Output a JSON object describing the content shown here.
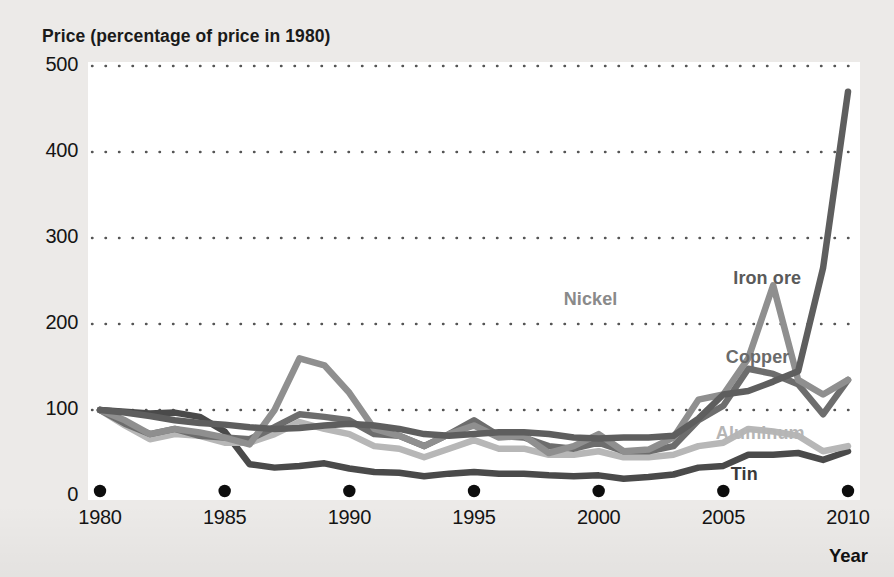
{
  "chart_data": {
    "type": "line",
    "title": "",
    "ylabel": "Price (percentage of price in 1980)",
    "xlabel": "Year",
    "xlim": [
      1980,
      2010
    ],
    "ylim": [
      0,
      500
    ],
    "yticks": [
      0,
      100,
      200,
      300,
      400,
      500
    ],
    "xticks": [
      1980,
      1985,
      1990,
      1995,
      2000,
      2005,
      2010
    ],
    "grid": "horizontal-dotted",
    "legend": "inline-labels-right",
    "x": [
      1980,
      1981,
      1982,
      1983,
      1984,
      1985,
      1986,
      1987,
      1988,
      1989,
      1990,
      1991,
      1992,
      1993,
      1994,
      1995,
      1996,
      1997,
      1998,
      1999,
      2000,
      2001,
      2002,
      2003,
      2004,
      2005,
      2006,
      2007,
      2008,
      2009,
      2010
    ],
    "series": [
      {
        "name": "Iron ore",
        "color": "#5e5e5e",
        "label_color": "#5a5a5a",
        "values": [
          100,
          97,
          93,
          88,
          85,
          83,
          80,
          78,
          79,
          82,
          84,
          82,
          78,
          72,
          70,
          72,
          74,
          74,
          72,
          68,
          67,
          68,
          68,
          70,
          90,
          118,
          122,
          133,
          145,
          265,
          470
        ]
      },
      {
        "name": "Nickel",
        "color": "#8f8f8f",
        "label_color": "#8a8a8a",
        "values": [
          100,
          88,
          72,
          78,
          74,
          68,
          60,
          100,
          160,
          152,
          120,
          78,
          70,
          58,
          72,
          82,
          68,
          70,
          50,
          58,
          72,
          52,
          54,
          68,
          112,
          118,
          160,
          245,
          135,
          118,
          135
        ]
      },
      {
        "name": "Copper",
        "color": "#6d6d6d",
        "label_color": "#6a6a6a",
        "values": [
          100,
          84,
          72,
          78,
          70,
          68,
          66,
          80,
          95,
          92,
          88,
          72,
          70,
          58,
          72,
          88,
          70,
          68,
          58,
          55,
          62,
          52,
          52,
          58,
          88,
          105,
          148,
          142,
          130,
          95,
          135
        ]
      },
      {
        "name": "Aluminum",
        "color": "#b7b7b7",
        "label_color": "#b5b5b5",
        "values": [
          100,
          82,
          66,
          72,
          70,
          62,
          62,
          72,
          86,
          78,
          72,
          58,
          55,
          45,
          55,
          65,
          55,
          55,
          48,
          48,
          52,
          45,
          45,
          48,
          58,
          62,
          78,
          75,
          70,
          52,
          58
        ]
      },
      {
        "name": "Tin",
        "color": "#4a4a4a",
        "label_color": "#3a3a3a",
        "values": [
          100,
          98,
          96,
          97,
          92,
          75,
          37,
          33,
          35,
          38,
          32,
          28,
          27,
          23,
          26,
          28,
          26,
          26,
          24,
          23,
          24,
          20,
          22,
          25,
          33,
          35,
          48,
          48,
          50,
          42,
          52
        ]
      }
    ],
    "annotations": [
      {
        "text": "Nickel",
        "x": 1998.6,
        "y": 228
      },
      {
        "text": "Iron ore",
        "x": 2005.4,
        "y": 252
      },
      {
        "text": "Copper",
        "x": 2005.1,
        "y": 160
      },
      {
        "text": "Aluminum",
        "x": 2004.7,
        "y": 72
      },
      {
        "text": "Tin",
        "x": 2005.3,
        "y": 24
      }
    ]
  }
}
